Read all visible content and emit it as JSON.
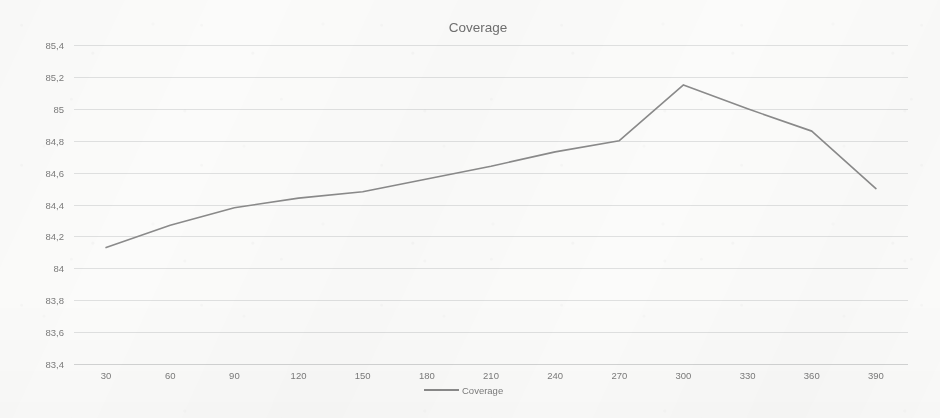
{
  "chart_data": {
    "type": "line",
    "title": "Coverage",
    "xlabel": "",
    "ylabel": "",
    "x": [
      30,
      60,
      90,
      120,
      150,
      180,
      210,
      240,
      270,
      300,
      330,
      360,
      390
    ],
    "categories": [
      "30",
      "60",
      "90",
      "120",
      "150",
      "180",
      "210",
      "240",
      "270",
      "300",
      "330",
      "360",
      "390"
    ],
    "series": [
      {
        "name": "Coverage",
        "values": [
          84.13,
          84.27,
          84.38,
          84.44,
          84.48,
          84.56,
          84.64,
          84.73,
          84.8,
          85.15,
          85.0,
          84.86,
          84.5
        ],
        "color": "#8a8a8a"
      }
    ],
    "ylim": [
      83.4,
      85.4
    ],
    "ytick_values": [
      85.4,
      85.2,
      85.0,
      84.8,
      84.6,
      84.4,
      84.2,
      84.0,
      83.8,
      83.6,
      83.4
    ],
    "ytick_labels": [
      "85,4",
      "85,2",
      "85",
      "84,8",
      "84,6",
      "84,4",
      "84,2",
      "84",
      "83,8",
      "83,6",
      "83,4"
    ],
    "xtick_labels": [
      "30",
      "60",
      "90",
      "120",
      "150",
      "180",
      "210",
      "240",
      "270",
      "300",
      "330",
      "360",
      "390"
    ],
    "grid": "horizontal",
    "legend_position": "bottom",
    "legend_entries": [
      "Coverage"
    ],
    "decimal_separator": ",",
    "background_color": "#fbfbfa",
    "grid_color": "#dfe0e0",
    "tick_label_color": "#7b7b7b",
    "title_color": "#6f6f6f"
  }
}
